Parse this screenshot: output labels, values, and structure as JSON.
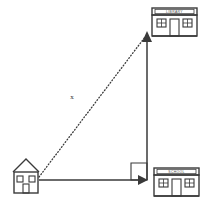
{
  "diagram": {
    "background_color": "#ffffff",
    "line_color": "#3a3a3a",
    "text_color": "#3a3a3a",
    "unknown_label": "x",
    "buildings": [
      {
        "id": "house",
        "name": "house",
        "label": "",
        "x": 12,
        "y": 158,
        "width": 28,
        "height": 36
      },
      {
        "id": "library",
        "name": "library",
        "label": "LIBRARY",
        "x": 151,
        "y": 7,
        "width": 46,
        "height": 30
      },
      {
        "id": "school",
        "name": "school",
        "label": "SCHOOL",
        "x": 153,
        "y": 167,
        "width": 46,
        "height": 30
      }
    ],
    "segments": [
      {
        "id": "hypotenuse",
        "name": "house-to-library-dotted",
        "style": "dotted",
        "from": [
          39,
          177
        ],
        "to": [
          146,
          36
        ],
        "label": "x",
        "label_pos": [
          72,
          97
        ]
      },
      {
        "id": "base",
        "name": "house-to-corner-arrow",
        "style": "solid",
        "from": [
          39,
          180
        ],
        "to": [
          145,
          180
        ],
        "arrow": "end"
      },
      {
        "id": "vertical",
        "name": "corner-to-library-arrow",
        "style": "solid",
        "from": [
          147,
          180
        ],
        "to": [
          147,
          33
        ],
        "arrow": "end"
      }
    ],
    "right_angle": {
      "name": "right-angle-marker",
      "x": 131,
      "y": 163,
      "size": 16
    }
  }
}
